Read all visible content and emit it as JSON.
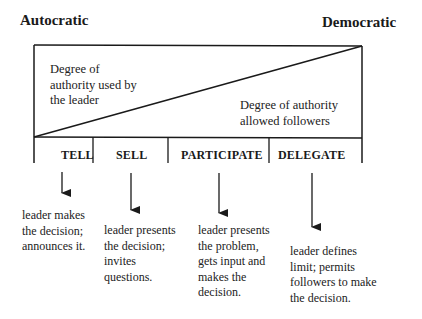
{
  "poles": {
    "left": "Autocratic",
    "right": "Democratic"
  },
  "regions": {
    "upper_left": [
      "Degree of",
      "authority used by",
      "the leader"
    ],
    "lower_right": [
      "Degree of authority",
      "allowed followers"
    ]
  },
  "styles": [
    {
      "label": "TELL",
      "description": [
        "leader makes",
        "the decision;",
        "announces it."
      ]
    },
    {
      "label": "SELL",
      "description": [
        "leader presents",
        "the decision;",
        "invites",
        "questions."
      ]
    },
    {
      "label": "PARTICIPATE",
      "description": [
        "leader presents",
        "the problem,",
        "gets input and",
        "makes the",
        "decision."
      ]
    },
    {
      "label": "DELEGATE",
      "description": [
        "leader defines",
        "limit; permits",
        "followers to make",
        "the decision."
      ]
    }
  ],
  "colors": {
    "line": "#1a1a1a",
    "text": "#222222",
    "background": "#ffffff"
  }
}
